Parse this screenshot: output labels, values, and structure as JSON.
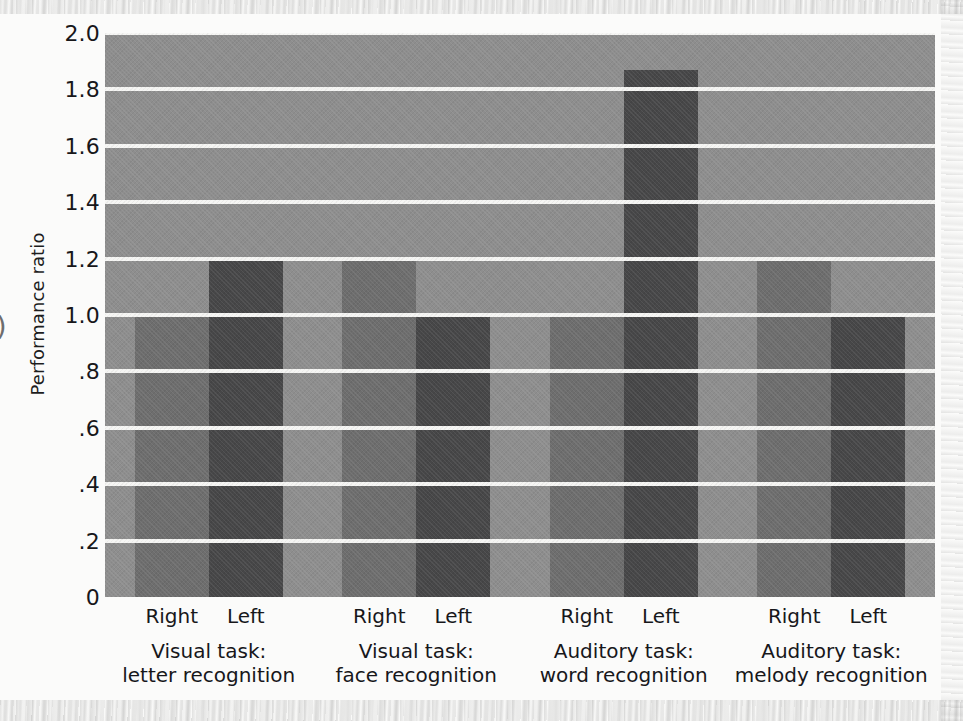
{
  "chart_data": {
    "type": "bar",
    "title": "",
    "xlabel": "",
    "ylabel": "Performance ratio",
    "ylim": [
      0,
      2.0
    ],
    "yticks": [
      "0",
      ".2",
      ".4",
      ".6",
      ".8",
      "1.0",
      "1.2",
      "1.4",
      "1.6",
      "1.8",
      "2.0"
    ],
    "ytick_values": [
      0,
      0.2,
      0.4,
      0.6,
      0.8,
      1.0,
      1.2,
      1.4,
      1.6,
      1.8,
      2.0
    ],
    "grid": true,
    "legend": "none",
    "categories": [
      "Visual task: letter recognition",
      "Visual task: face recognition",
      "Auditory task: word recognition",
      "Auditory task: melody recognition"
    ],
    "series": [
      {
        "name": "Right",
        "values": [
          1.0,
          1.2,
          1.0,
          1.2
        ]
      },
      {
        "name": "Left",
        "values": [
          1.2,
          1.0,
          1.87,
          1.0
        ]
      }
    ]
  },
  "axes": {
    "y_title": "Performance ratio",
    "y_ticks": [
      {
        "label": "2.0",
        "value": 2.0
      },
      {
        "label": "1.8",
        "value": 1.8
      },
      {
        "label": "1.6",
        "value": 1.6
      },
      {
        "label": "1.4",
        "value": 1.4
      },
      {
        "label": "1.2",
        "value": 1.2
      },
      {
        "label": "1.0",
        "value": 1.0
      },
      {
        "label": ".8",
        "value": 0.8
      },
      {
        "label": ".6",
        "value": 0.6
      },
      {
        "label": ".4",
        "value": 0.4
      },
      {
        "label": ".2",
        "value": 0.2
      },
      {
        "label": "0",
        "value": 0.0
      }
    ]
  },
  "groups": [
    {
      "line1": "Visual task:",
      "line2": "letter recognition",
      "bars": [
        {
          "hand": "Right",
          "value": 1.0,
          "style": "right-hand"
        },
        {
          "hand": "Left",
          "value": 1.2,
          "style": "left-hand"
        }
      ]
    },
    {
      "line1": "Visual task:",
      "line2": "face recognition",
      "bars": [
        {
          "hand": "Right",
          "value": 1.2,
          "style": "right-hand"
        },
        {
          "hand": "Left",
          "value": 1.0,
          "style": "left-hand"
        }
      ]
    },
    {
      "line1": "Auditory task:",
      "line2": "word recognition",
      "bars": [
        {
          "hand": "Right",
          "value": 1.0,
          "style": "right-hand"
        },
        {
          "hand": "Left",
          "value": 1.87,
          "style": "left-hand"
        }
      ]
    },
    {
      "line1": "Auditory task:",
      "line2": "melody recognition",
      "bars": [
        {
          "hand": "Right",
          "value": 1.2,
          "style": "right-hand"
        },
        {
          "hand": "Left",
          "value": 1.0,
          "style": "left-hand"
        }
      ]
    }
  ],
  "colors": {
    "plot_background": "#8e8e8e",
    "gridline": "#f6f6f4",
    "bar_right": "#6e6e6e",
    "bar_left": "#474748",
    "page_background": "#fbfbfa",
    "text": "#17171a"
  },
  "edge_artifact": ")"
}
